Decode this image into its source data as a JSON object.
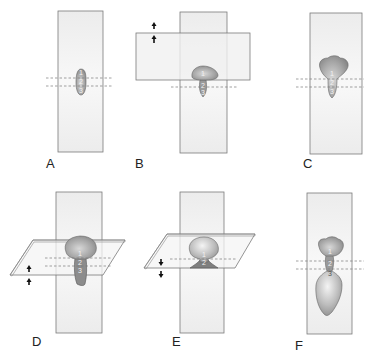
{
  "figure": {
    "colors": {
      "strip_fill": "#f1f1f1",
      "strip_stroke": "#777777",
      "blob_fill": "#8e8e8e",
      "blob_highlight": "#d6d6d6",
      "dash": "#7a7a7a",
      "arrow": "#111111",
      "label": "#222222"
    },
    "panels": [
      {
        "id": "A",
        "label": "A",
        "numbers": [
          "1",
          "2",
          "3"
        ],
        "arrows": "none",
        "plane": "none"
      },
      {
        "id": "B",
        "label": "B",
        "numbers": [
          "1",
          "2",
          "3"
        ],
        "arrows": "up",
        "plane": "horizontal-strip"
      },
      {
        "id": "C",
        "label": "C",
        "numbers": [
          "1",
          "2",
          "3"
        ],
        "arrows": "none",
        "plane": "none"
      },
      {
        "id": "D",
        "label": "D",
        "numbers": [
          "1",
          "2",
          "3"
        ],
        "arrows": "up",
        "plane": "oblique-plane"
      },
      {
        "id": "E",
        "label": "E",
        "numbers": [
          "1",
          "2"
        ],
        "arrows": "down",
        "plane": "oblique-plane"
      },
      {
        "id": "F",
        "label": "F",
        "numbers": [
          "1",
          "2",
          "3"
        ],
        "arrows": "none",
        "plane": "none"
      }
    ]
  }
}
